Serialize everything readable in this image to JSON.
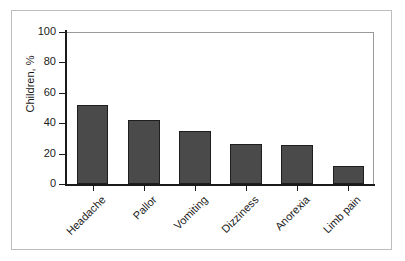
{
  "chart_data": {
    "type": "bar",
    "title": "",
    "subtitle": "",
    "xlabel": "",
    "ylabel": "Children, %",
    "categories": [
      "Headache",
      "Pallor",
      "Vomiting",
      "Dizziness",
      "Anorexia",
      "Limb pain"
    ],
    "values": [
      52,
      42,
      35,
      26,
      25.5,
      12
    ],
    "ylim": [
      0,
      100
    ],
    "yticks": [
      0,
      20,
      40,
      60,
      80,
      100
    ],
    "ytick_labels": [
      "0",
      "20",
      "40",
      "60",
      "80",
      "100"
    ],
    "grid": false,
    "legend": null,
    "annotations": [],
    "bar_color": "#4a4a4a",
    "bar_edge_color": "#1e1e1e",
    "axis_color": "#1a1a1a",
    "frame_color": "#9a9a9a",
    "background_color": "#ffffff",
    "outer_border_color": "#bdbdbd",
    "xlabel_rotation": -45
  }
}
